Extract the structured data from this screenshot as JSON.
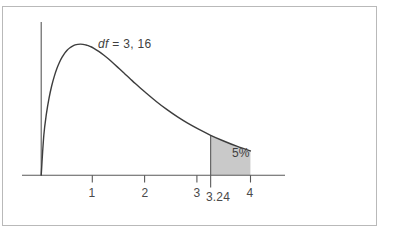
{
  "figure": {
    "frame_color": "#b9b9b9",
    "background": "#ffffff"
  },
  "annotations": {
    "df_prefix": "df",
    "df_rest": " = 3, 16",
    "tail_percent": "5%",
    "critical_value": "3.24"
  },
  "axis": {
    "tick_labels": [
      "1",
      "2",
      "3",
      "4"
    ]
  },
  "chart_data": {
    "type": "line",
    "title": "",
    "subtitle": "",
    "xlabel": "",
    "ylabel": "",
    "xlim": [
      0,
      4.65
    ],
    "ylim": [
      0,
      0.82
    ],
    "grid": false,
    "legend": null,
    "distribution": "F-distribution",
    "df1": 3,
    "df2": 16,
    "critical_value": 3.24,
    "tail_area": 0.05,
    "tail_area_label": "5%",
    "shaded_region": {
      "from": 3.24,
      "to": 4.0,
      "fill_color": "#c9c9c9",
      "label": "5%"
    },
    "x_ticks": [
      1,
      2,
      3,
      4
    ],
    "x_tick_labels": [
      "1",
      "2",
      "3",
      "4"
    ],
    "mode_x": 0.75,
    "annotations": [
      {
        "text": "df = 3, 16",
        "x": 1.1,
        "y": 0.74
      },
      {
        "text": "5%",
        "x": 3.66,
        "y": 0.165
      },
      {
        "text": "3.24",
        "x": 3.24,
        "y": -0.09
      }
    ],
    "x": [
      0.0,
      0.05,
      0.1,
      0.15,
      0.2,
      0.25,
      0.3,
      0.35,
      0.4,
      0.45,
      0.5,
      0.55,
      0.6,
      0.65,
      0.7,
      0.75,
      0.8,
      0.85,
      0.9,
      0.95,
      1.0,
      1.1,
      1.2,
      1.3,
      1.4,
      1.5,
      1.6,
      1.7,
      1.8,
      1.9,
      2.0,
      2.2,
      2.4,
      2.6,
      2.8,
      3.0,
      3.24,
      3.5,
      3.75,
      4.0,
      4.25,
      4.5
    ],
    "y": [
      0.0,
      0.214,
      0.33,
      0.414,
      0.479,
      0.531,
      0.573,
      0.607,
      0.634,
      0.656,
      0.673,
      0.685,
      0.694,
      0.7,
      0.703,
      0.704,
      0.703,
      0.7,
      0.696,
      0.69,
      0.683,
      0.665,
      0.644,
      0.621,
      0.596,
      0.57,
      0.544,
      0.518,
      0.492,
      0.467,
      0.443,
      0.396,
      0.353,
      0.314,
      0.279,
      0.248,
      0.214,
      0.182,
      0.154,
      0.13,
      0.11,
      0.094
    ]
  }
}
